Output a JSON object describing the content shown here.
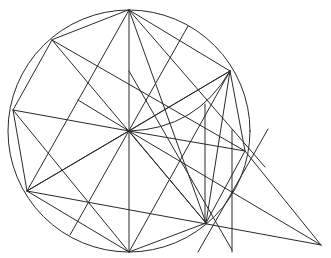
{
  "diagram": {
    "stroke_color": "#2a2a2a",
    "background": "#ffffff",
    "points": {
      "T": [
        129,
        10
      ],
      "O": [
        129,
        131
      ],
      "B": [
        129,
        252
      ],
      "P1": [
        52,
        40
      ],
      "P2": [
        13,
        110
      ],
      "P3": [
        27,
        191
      ],
      "P4": [
        230,
        71
      ],
      "P5": [
        245,
        151
      ],
      "P6": [
        206,
        223
      ],
      "F": [
        321,
        245
      ],
      "Q1": [
        78,
        100
      ],
      "C1": [
        188,
        26
      ],
      "C2": [
        70,
        235
      ],
      "V1a": [
        205,
        104
      ],
      "V1b": [
        205,
        224
      ],
      "V2a": [
        232,
        130
      ],
      "V2b": [
        232,
        252
      ],
      "D1a": [
        268,
        129
      ],
      "D1b": [
        198,
        252
      ],
      "E1": [
        265,
        167
      ],
      "M1": [
        129,
        71
      ],
      "M2": [
        232,
        250
      ]
    },
    "circle": {
      "center": "O",
      "radius_ref": "T"
    },
    "polygon": [
      "T",
      "P4",
      "P5",
      "P6",
      "B",
      "P3",
      "P2",
      "P1"
    ],
    "segments": [
      [
        "O",
        "T"
      ],
      [
        "O",
        "B"
      ],
      [
        "O",
        "P2"
      ],
      [
        "O",
        "P3"
      ],
      [
        "O",
        "P4"
      ],
      [
        "O",
        "P5"
      ],
      [
        "O",
        "P6"
      ],
      [
        "O",
        "Q1"
      ],
      [
        "O",
        "F"
      ],
      [
        "T",
        "P3"
      ],
      [
        "T",
        "E1"
      ],
      [
        "T",
        "P6"
      ],
      [
        "P1",
        "P5"
      ],
      [
        "P1",
        "P6"
      ],
      [
        "P2",
        "B"
      ],
      [
        "P3",
        "F"
      ],
      [
        "P3",
        "P4"
      ],
      [
        "P4",
        "P6"
      ],
      [
        "P4",
        "B"
      ],
      [
        "P5",
        "F"
      ],
      [
        "C1",
        "C2"
      ],
      [
        "V1a",
        "V1b"
      ],
      [
        "V2a",
        "V2b"
      ],
      [
        "D1a",
        "D1b"
      ],
      [
        "M1",
        "M2"
      ]
    ],
    "arcs": [
      {
        "from": "O",
        "to": "P4",
        "bulge": "below"
      }
    ]
  }
}
